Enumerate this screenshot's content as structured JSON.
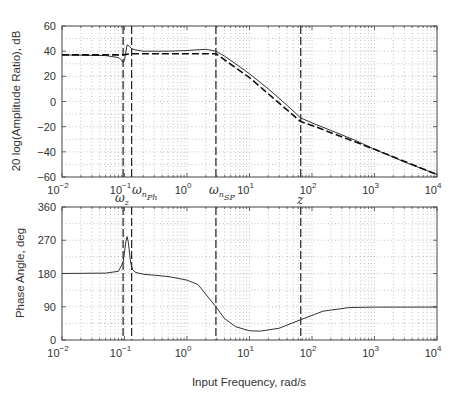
{
  "chart_data": [
    {
      "type": "line",
      "panel": "magnitude",
      "title": "",
      "xlabel": "",
      "ylabel": "20 log(Amplitude Ratio), dB",
      "xscale": "log",
      "xlim": [
        0.01,
        10000
      ],
      "ylim": [
        -60,
        60
      ],
      "xticks": [
        "10^-2",
        "10^-1",
        "10^0",
        "10^1",
        "10^2",
        "10^3",
        "10^4"
      ],
      "yticks": [
        60,
        40,
        20,
        0,
        -20,
        -40,
        -60
      ],
      "grid": "dotted major and minor",
      "series": [
        {
          "name": "exact",
          "style": "solid",
          "x": [
            0.01,
            0.05,
            0.08,
            0.09,
            0.095,
            0.1,
            0.11,
            0.12,
            0.13,
            0.15,
            0.2,
            0.5,
            1,
            2,
            2.9,
            4,
            6,
            10,
            20,
            40,
            66,
            100,
            200,
            500,
            1000,
            3000,
            10000
          ],
          "y": [
            37,
            36.5,
            35,
            33,
            31,
            33,
            45,
            44,
            42,
            41,
            40,
            40,
            40.5,
            41.5,
            40,
            36,
            30,
            22,
            10,
            -3,
            -13,
            -17,
            -23,
            -31,
            -38,
            -48,
            -58
          ]
        },
        {
          "name": "asymptotic",
          "style": "dashed",
          "x": [
            0.01,
            0.095,
            0.13,
            1,
            2.9,
            10,
            66,
            100,
            1000,
            10000
          ],
          "y": [
            37,
            37,
            38,
            38,
            38,
            19,
            -16,
            -19,
            -38,
            -58
          ]
        }
      ],
      "annotations": [
        {
          "label": "ω_z",
          "x": 0.095,
          "style": "dashed vertical"
        },
        {
          "label": "ω_n_Ph",
          "x": 0.13,
          "style": "dashed vertical"
        },
        {
          "label": "ω_n_SP",
          "x": 2.9,
          "style": "dashed vertical"
        },
        {
          "label": "z",
          "x": 66,
          "style": "dashed vertical"
        }
      ]
    },
    {
      "type": "line",
      "panel": "phase",
      "title": "",
      "xlabel": "Input Frequency, rad/s",
      "ylabel": "Phase Angle, deg",
      "xscale": "log",
      "xlim": [
        0.01,
        10000
      ],
      "ylim": [
        0,
        360
      ],
      "xticks": [
        "10^-2",
        "10^-1",
        "10^0",
        "10^1",
        "10^2",
        "10^3",
        "10^4"
      ],
      "yticks": [
        360,
        270,
        180,
        90,
        0
      ],
      "grid": "dotted major and minor",
      "series": [
        {
          "name": "phase",
          "style": "solid",
          "x": [
            0.01,
            0.05,
            0.08,
            0.095,
            0.105,
            0.11,
            0.115,
            0.125,
            0.135,
            0.15,
            0.2,
            0.5,
            1,
            1.5,
            2.9,
            4,
            6,
            10,
            15,
            30,
            66,
            150,
            400,
            1000,
            10000
          ],
          "y": [
            180,
            181,
            186,
            210,
            265,
            280,
            265,
            210,
            190,
            183,
            178,
            172,
            162,
            150,
            90,
            58,
            36,
            25,
            24,
            32,
            55,
            78,
            88,
            89,
            89
          ]
        }
      ],
      "annotations": [
        {
          "label": "ω_z",
          "x": 0.095,
          "style": "dashed vertical"
        },
        {
          "label": "ω_n_Ph",
          "x": 0.13,
          "style": "dashed vertical"
        },
        {
          "label": "ω_n_SP",
          "x": 2.9,
          "style": "dashed vertical"
        },
        {
          "label": "z",
          "x": 66,
          "style": "dashed vertical"
        }
      ]
    }
  ],
  "labels": {
    "mag_ylabel": "20 log(Amplitude Ratio), dB",
    "phase_ylabel": "Phase Angle, deg",
    "xlabel": "Input Frequency, rad/s",
    "markers": {
      "wz_main": "ω",
      "wz_sub": "z",
      "wnph_main": "ω",
      "wnph_sub1": "n",
      "wnph_sub2": "Ph",
      "wnsp_main": "ω",
      "wnsp_sub1": "n",
      "wnsp_sub2": "SP",
      "z": "z"
    }
  }
}
